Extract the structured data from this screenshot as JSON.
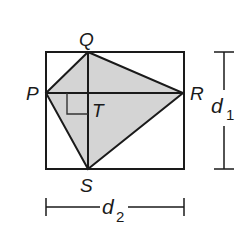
{
  "diagram": {
    "type": "kite inscribed in rectangle",
    "colors": {
      "stroke": "#1a1a1a",
      "fill": "#d4d4d4",
      "background": "#ffffff"
    },
    "points": {
      "P": {
        "label": "P",
        "x": 46,
        "y": 93
      },
      "Q": {
        "label": "Q",
        "x": 88,
        "y": 52
      },
      "R": {
        "label": "R",
        "x": 183,
        "y": 93
      },
      "S": {
        "label": "S",
        "x": 88,
        "y": 169
      },
      "T": {
        "label": "T",
        "x": 88,
        "y": 93
      }
    },
    "rectangle": {
      "x": 46,
      "y": 52,
      "width": 138,
      "height": 117
    },
    "right_angle_marker": "at T",
    "dimensions": {
      "d1": {
        "label": "d",
        "subscript": "1",
        "orientation": "vertical"
      },
      "d2": {
        "label": "d",
        "subscript": "2",
        "orientation": "horizontal"
      }
    }
  }
}
